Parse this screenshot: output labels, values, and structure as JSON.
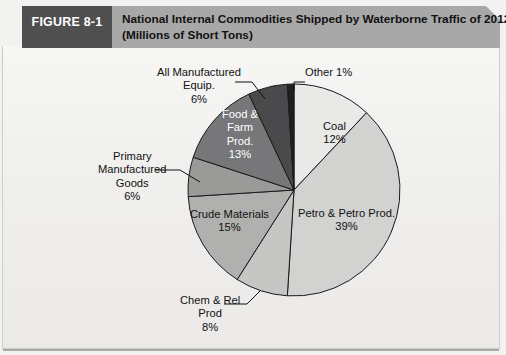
{
  "figure": {
    "tag_label": "FIGURE 8-1",
    "title_line1": "National Internal Commodities Shipped by Waterborne Traffic of 2012",
    "title_line2": "(Millions of Short Tons)",
    "tag_bg": "#4f4f4f",
    "band_bg": "#a8a8a8",
    "page_bg": "#f2f2f0"
  },
  "chart_data": {
    "type": "pie",
    "title": "National Internal Commodities Shipped by Waterborne Traffic of 2012 (Millions of Short Tons)",
    "unit": "percent",
    "legend": "none",
    "start_angle_deg": 0,
    "direction": "clockwise",
    "categories": [
      "Coal",
      "Petro & Petro Prod.",
      "Chem & Rel Prod",
      "Crude Materials",
      "Primary Manufactured Goods",
      "Food & Farm Prod.",
      "All Manufactured Equip.",
      "Other"
    ],
    "values": [
      12,
      39,
      8,
      15,
      6,
      13,
      6,
      1
    ],
    "slices": [
      {
        "name": "Coal",
        "label_lines": [
          "Coal",
          "12%"
        ],
        "value": 12,
        "color": "#e9e9e7",
        "text_color": "#111111",
        "placement": "inside",
        "label_x": 321,
        "label_y": 74
      },
      {
        "name": "Petro & Petro Prod.",
        "label_lines": [
          "Petro & Petro Prod.",
          "39%"
        ],
        "value": 39,
        "color": "#d2d2d0",
        "text_color": "#111111",
        "placement": "inside",
        "label_x": 296,
        "label_y": 161
      },
      {
        "name": "Chem & Rel Prod",
        "label_lines": [
          "Chem & Rel",
          "Prod",
          "8%"
        ],
        "value": 8,
        "color": "#c6c6c4",
        "text_color": "#111111",
        "placement": "outside",
        "label_x": 178,
        "label_y": 248
      },
      {
        "name": "Crude Materials",
        "label_lines": [
          "Crude Materials",
          "15%"
        ],
        "value": 15,
        "color": "#b0b0ae",
        "text_color": "#111111",
        "placement": "inside",
        "label_x": 188,
        "label_y": 162
      },
      {
        "name": "Primary Manufactured Goods",
        "label_lines": [
          "Primary",
          "Manufactured",
          "Goods",
          "6%"
        ],
        "value": 6,
        "color": "#9a9a98",
        "text_color": "#111111",
        "placement": "outside",
        "label_x": 96,
        "label_y": 104
      },
      {
        "name": "Food & Farm Prod.",
        "label_lines": [
          "Food &",
          "Farm",
          "Prod.",
          "13%"
        ],
        "value": 13,
        "color": "#77777a",
        "text_color": "#ffffff",
        "placement": "inside",
        "label_x": 220,
        "label_y": 62
      },
      {
        "name": "All Manufactured Equip.",
        "label_lines": [
          "All Manufactured",
          "Equip.",
          "6%"
        ],
        "value": 6,
        "color": "#4a4a4c",
        "text_color": "#111111",
        "placement": "outside",
        "label_x": 155,
        "label_y": 20
      },
      {
        "name": "Other",
        "label_lines": [
          "Other 1%"
        ],
        "value": 1,
        "color": "#1f1f20",
        "text_color": "#111111",
        "placement": "outside",
        "label_x": 303,
        "label_y": 20
      }
    ]
  }
}
